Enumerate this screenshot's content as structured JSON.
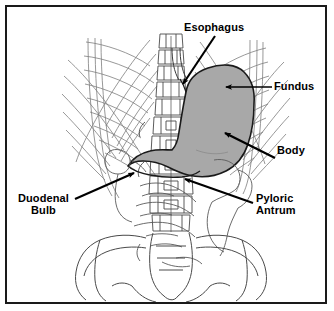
{
  "figure": {
    "colors": {
      "frame": "#1a1a1a",
      "background": "#ffffff",
      "stomach_fill": "#a8a8a8",
      "stomach_outline": "#1a1a1a",
      "bone_outline": "#555555",
      "rib_line": "#777777",
      "arrow": "#000000",
      "label_text": "#000000"
    }
  },
  "labels": [
    {
      "id": "esophagus",
      "text": "Esophagus",
      "lines": [
        "Esophagus"
      ],
      "arrow": {
        "from_x": 215,
        "from_y": 36,
        "to_x": 181,
        "to_y": 86,
        "head": "point"
      }
    },
    {
      "id": "fundus",
      "text": "Fundus",
      "lines": [
        "Fundus"
      ],
      "arrow": {
        "from_x": 272,
        "from_y": 87,
        "to_x": 223,
        "to_y": 87,
        "head": "triangle"
      }
    },
    {
      "id": "body",
      "text": "Body",
      "lines": [
        "Body"
      ],
      "arrow": {
        "from_x": 275,
        "from_y": 158,
        "to_x": 222,
        "to_y": 131,
        "head": "triangle"
      }
    },
    {
      "id": "duodenal-bulb",
      "text": "Duodenal Bulb",
      "lines": [
        "Duodenal",
        "Bulb"
      ],
      "arrow": {
        "from_x": 75,
        "from_y": 199,
        "to_x": 137,
        "to_y": 171,
        "head": "triangle"
      }
    },
    {
      "id": "pyloric-antrum",
      "text": "Pyloric Antrum",
      "lines": [
        "Pyloric",
        "Antrum"
      ],
      "arrow": {
        "from_x": 253,
        "from_y": 203,
        "to_x": 182,
        "to_y": 177,
        "head": "triangle"
      }
    }
  ],
  "anatomy": {
    "parts": [
      {
        "name": "stomach",
        "label": "Stomach",
        "shaded": true
      },
      {
        "name": "esophagus",
        "label": "Esophagus",
        "shaded": false
      },
      {
        "name": "ribcage",
        "label": "Ribcage",
        "shaded": false
      },
      {
        "name": "spine",
        "label": "Lumbar spine",
        "shaded": false
      },
      {
        "name": "pelvis",
        "label": "Pelvis",
        "shaded": false
      },
      {
        "name": "intestines",
        "label": "Intestinal loops",
        "shaded": false
      }
    ]
  }
}
